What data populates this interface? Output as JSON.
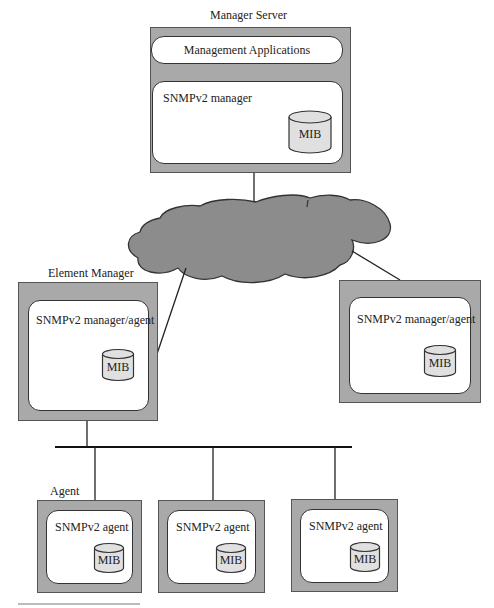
{
  "diagram": {
    "type": "network-management-architecture",
    "colors": {
      "device_fill": "#a9a9a9",
      "cloud_fill": "#8c8c8c",
      "mib_fill": "#e0e0e0",
      "line": "#222222"
    },
    "manager_server": {
      "label": "Manager Server",
      "apps_label": "Management Applications",
      "component_label": "SNMPv2 manager",
      "mib_label": "MIB"
    },
    "network": {
      "shape": "cloud"
    },
    "element_manager": {
      "label": "Element Manager",
      "component_label": "SNMPv2 manager/agent",
      "mib_label": "MIB"
    },
    "peer_manager": {
      "label": "",
      "component_label": "SNMPv2 manager/agent",
      "mib_label": "MIB"
    },
    "agent_group_label": "Agent",
    "agents": [
      {
        "component_label": "SNMPv2 agent",
        "mib_label": "MIB"
      },
      {
        "component_label": "SNMPv2 agent",
        "mib_label": "MIB"
      },
      {
        "component_label": "SNMPv2 agent",
        "mib_label": "MIB"
      }
    ],
    "edges": [
      {
        "from": "Manager Server",
        "to": "network"
      },
      {
        "from": "network",
        "to": "Element Manager"
      },
      {
        "from": "network",
        "to": "SNMPv2 manager/agent (right)"
      },
      {
        "from": "Element Manager",
        "to": "LAN bus"
      },
      {
        "from": "LAN bus",
        "to": "Agent 1"
      },
      {
        "from": "LAN bus",
        "to": "Agent 2"
      },
      {
        "from": "LAN bus",
        "to": "Agent 3"
      }
    ]
  }
}
